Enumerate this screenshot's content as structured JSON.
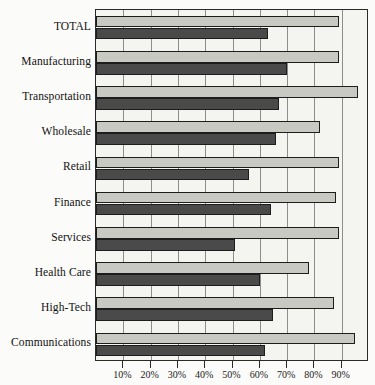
{
  "chart_data": {
    "type": "bar",
    "orientation": "horizontal",
    "title": "",
    "subtitle": "",
    "xlabel": "",
    "ylabel": "",
    "xlim": [
      0,
      100
    ],
    "grid": true,
    "legend_position": "none",
    "categories": [
      "TOTAL",
      "Manufacturing",
      "Transportation",
      "Wholesale",
      "Retail",
      "Finance",
      "Services",
      "Health Care",
      "High-Tech",
      "Communications"
    ],
    "tick_labels": [
      "10%",
      "20%",
      "30%",
      "40%",
      "50%",
      "60%",
      "70%",
      "80%",
      "90%"
    ],
    "tick_values": [
      10,
      20,
      30,
      40,
      50,
      60,
      70,
      80,
      90
    ],
    "series": [
      {
        "name": "Upper bar",
        "color": "#c9c9c4",
        "values": [
          89,
          89,
          96,
          82,
          89,
          88,
          89,
          78,
          87,
          95
        ]
      },
      {
        "name": "Lower bar",
        "color": "#4a4a4a",
        "values": [
          63,
          70,
          67,
          66,
          56,
          64,
          51,
          60,
          65,
          62
        ]
      }
    ]
  }
}
